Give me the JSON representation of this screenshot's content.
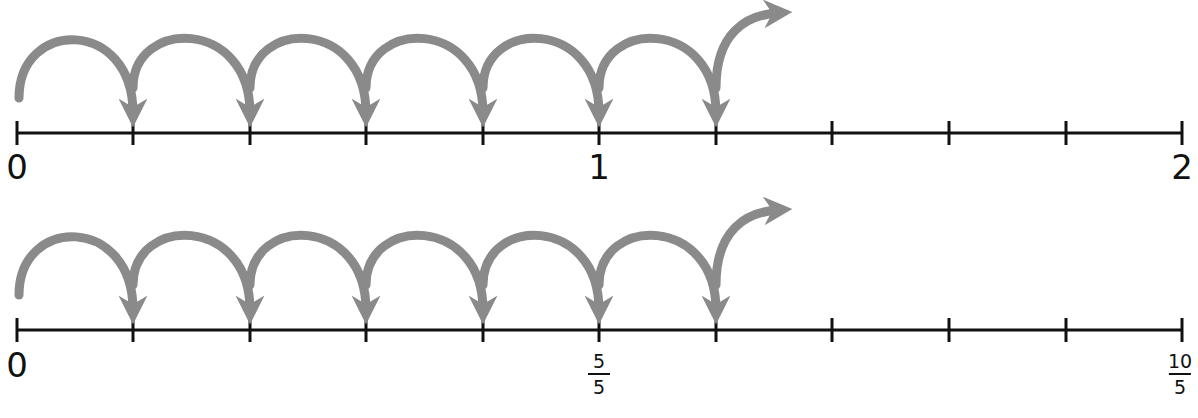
{
  "diagram": {
    "title": "",
    "colors": {
      "line": "#111111",
      "arrow": "#8a8a8a",
      "background": "#ffffff"
    },
    "tick_x": [
      17,
      133,
      250,
      366,
      483,
      599,
      716,
      832,
      949,
      1066,
      1182
    ],
    "number_lines": [
      {
        "id": "whole-numbers",
        "axis_y": 133,
        "ticks": 11,
        "jumps": 6,
        "labels": [
          {
            "tick": 0,
            "text": "0",
            "type": "whole"
          },
          {
            "tick": 5,
            "text": "1",
            "type": "whole"
          },
          {
            "tick": 10,
            "text": "2",
            "type": "whole"
          }
        ]
      },
      {
        "id": "fifths",
        "axis_y": 330,
        "ticks": 11,
        "jumps": 6,
        "labels": [
          {
            "tick": 0,
            "text": "0",
            "type": "whole"
          },
          {
            "tick": 5,
            "numerator": "5",
            "denominator": "5",
            "type": "fraction"
          },
          {
            "tick": 10,
            "numerator": "10",
            "denominator": "5",
            "type": "fraction"
          }
        ]
      }
    ]
  },
  "labels": {
    "line1": {
      "zero": "0",
      "one": "1",
      "two": "2"
    },
    "line2": {
      "zero": "0",
      "five_num": "5",
      "five_den": "5",
      "ten_num": "10",
      "ten_den": "5"
    }
  }
}
